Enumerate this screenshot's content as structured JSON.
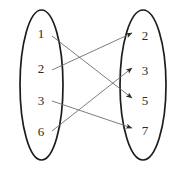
{
  "diagram": {
    "type": "bipartite-mapping",
    "title": "",
    "colors": {
      "background": "#ffffff",
      "ellipse_stroke": "#1d1d1d",
      "edge_stroke": "#6e6e6e",
      "arrowhead": "#2b2b2b",
      "label_text": "#2b2b2b"
    },
    "domain_set": {
      "name": "domain-ellipse",
      "cx": 41.5,
      "cy": 85,
      "rx": 21.5,
      "ry": 75,
      "nodes": [
        {
          "label": "1",
          "x": 41,
          "y": 33
        },
        {
          "label": "2",
          "x": 41,
          "y": 68
        },
        {
          "label": "3",
          "x": 41,
          "y": 100
        },
        {
          "label": "6",
          "x": 41,
          "y": 131
        }
      ]
    },
    "codomain_set": {
      "name": "codomain-ellipse",
      "cx": 143,
      "cy": 85,
      "rx": 23,
      "ry": 75,
      "nodes": [
        {
          "label": "2",
          "x": 145,
          "y": 35
        },
        {
          "label": "3",
          "x": 145,
          "y": 70
        },
        {
          "label": "5",
          "x": 145,
          "y": 100
        },
        {
          "label": "7",
          "x": 145,
          "y": 130
        }
      ]
    },
    "edges": [
      {
        "from": "1",
        "to": "5",
        "x1": 52,
        "y1": 36,
        "x2": 132,
        "y2": 98
      },
      {
        "from": "2",
        "to": "2",
        "x1": 52,
        "y1": 70,
        "x2": 132,
        "y2": 33
      },
      {
        "from": "3",
        "to": "7",
        "x1": 52,
        "y1": 101,
        "x2": 132,
        "y2": 128
      },
      {
        "from": "6",
        "to": "3",
        "x1": 52,
        "y1": 131,
        "x2": 132,
        "y2": 68
      }
    ]
  }
}
